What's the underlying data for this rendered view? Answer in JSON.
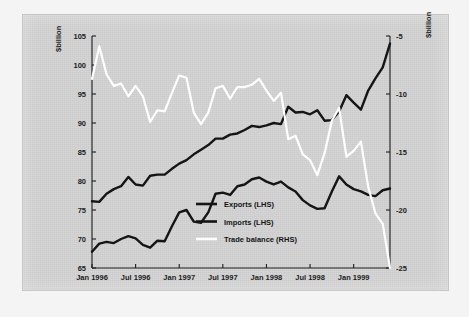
{
  "figure": {
    "background_color": "#f4f4f4",
    "plate_color": "#d2d2d2"
  },
  "chart_data": {
    "type": "line",
    "title": "",
    "subtitle": "",
    "xlabel": "",
    "ylabel": "$billion",
    "y2label": "$billion",
    "ylim": [
      65,
      105
    ],
    "y2lim": [
      -25,
      -5
    ],
    "grid": false,
    "legend_position": "center",
    "left_axis": {
      "unit_label": "$billion",
      "ticks": [
        "105",
        "100",
        "95",
        "90",
        "85",
        "80",
        "75",
        "70",
        "65"
      ],
      "tick_values": [
        105,
        100,
        95,
        90,
        85,
        80,
        75,
        70,
        65
      ]
    },
    "right_axis": {
      "unit_label": "$billion",
      "ticks": [
        "-5",
        "-10",
        "-15",
        "-20",
        "-25"
      ],
      "tick_values": [
        -5,
        -10,
        -15,
        -20,
        -25
      ]
    },
    "x_tick_labels": [
      "Jan 1996",
      "Jul 1996",
      "Jan 1997",
      "Jul 1997",
      "Jan 1998",
      "Jul 1998",
      "Jan 1999"
    ],
    "x_tick_index": [
      0,
      6,
      12,
      18,
      24,
      30,
      36
    ],
    "x": [
      "Jan 1996",
      "Feb 1996",
      "Mar 1996",
      "Apr 1996",
      "May 1996",
      "Jun 1996",
      "Jul 1996",
      "Aug 1996",
      "Sep 1996",
      "Oct 1996",
      "Nov 1996",
      "Dec 1996",
      "Jan 1997",
      "Feb 1997",
      "Mar 1997",
      "Apr 1997",
      "May 1997",
      "Jun 1997",
      "Jul 1997",
      "Aug 1997",
      "Sep 1997",
      "Oct 1997",
      "Nov 1997",
      "Dec 1997",
      "Jan 1998",
      "Feb 1998",
      "Mar 1998",
      "Apr 1998",
      "May 1998",
      "Jun 1998",
      "Jul 1998",
      "Aug 1998",
      "Sep 1998",
      "Oct 1998",
      "Nov 1998",
      "Dec 1998",
      "Jan 1999",
      "Feb 1999",
      "Mar 1999",
      "Apr 1999",
      "May 1999",
      "Jun 1999"
    ],
    "series": [
      {
        "name": "Exports (LHS)",
        "legend_label": "Exports (LHS)",
        "axis": "left",
        "color": "#151515",
        "values": [
          67.8,
          69.2,
          69.5,
          69.3,
          70.0,
          70.5,
          70.1,
          69.0,
          68.5,
          69.7,
          69.6,
          72.2,
          74.6,
          75.0,
          73.0,
          72.8,
          74.6,
          77.8,
          78.0,
          77.6,
          79.1,
          79.4,
          80.3,
          80.6,
          79.9,
          79.4,
          79.9,
          78.9,
          78.2,
          76.7,
          75.8,
          75.2,
          75.3,
          78.2,
          80.8,
          79.4,
          78.6,
          78.2,
          77.6,
          77.4,
          78.4,
          78.7
        ]
      },
      {
        "name": "Imports (LHS)",
        "legend_label": "Imports (LHS)",
        "axis": "left",
        "color": "#151515",
        "values": [
          76.5,
          76.4,
          77.8,
          78.6,
          79.1,
          80.7,
          79.4,
          79.2,
          80.9,
          81.1,
          81.1,
          82.1,
          83.0,
          83.6,
          84.6,
          85.4,
          86.2,
          87.3,
          87.3,
          88.0,
          88.2,
          88.8,
          89.5,
          89.3,
          89.6,
          90.0,
          89.8,
          92.8,
          91.8,
          91.9,
          91.5,
          92.2,
          90.4,
          90.5,
          92.0,
          94.8,
          93.5,
          92.3,
          95.6,
          97.7,
          99.6,
          103.7
        ]
      },
      {
        "name": "Trade balance (RHS)",
        "legend_label": "Trade balance (RHS)",
        "axis": "right",
        "color": "#ffffff",
        "values": [
          -8.7,
          -5.9,
          -8.3,
          -9.3,
          -9.1,
          -10.2,
          -9.3,
          -10.2,
          -12.4,
          -11.4,
          -11.5,
          -9.9,
          -8.4,
          -8.6,
          -11.6,
          -12.6,
          -11.6,
          -9.5,
          -9.3,
          -10.4,
          -9.4,
          -9.4,
          -9.2,
          -8.7,
          -9.7,
          -10.6,
          -9.9,
          -13.9,
          -13.6,
          -15.2,
          -15.7,
          -17.0,
          -15.1,
          -12.3,
          -11.2,
          -15.4,
          -14.9,
          -14.1,
          -18.0,
          -20.3,
          -21.2,
          -25.0
        ]
      }
    ]
  },
  "legend": {
    "items": [
      {
        "label": "Exports (LHS)",
        "swatch_color": "#151515"
      },
      {
        "label": "Imports (LHS)",
        "swatch_color": "#151515"
      },
      {
        "label": "Trade balance (RHS)",
        "swatch_color": "#ffffff"
      }
    ]
  }
}
